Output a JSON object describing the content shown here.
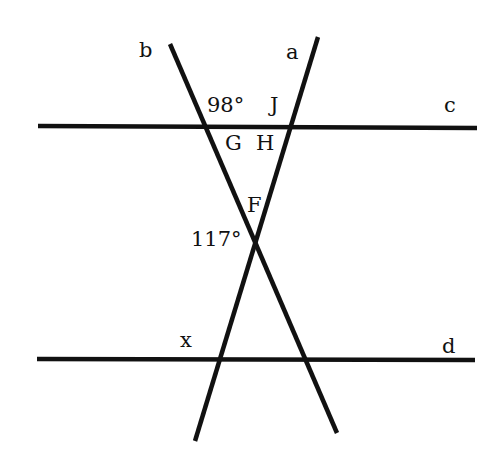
{
  "diagram": {
    "lines": {
      "c": {
        "label": "c",
        "x1": 38,
        "y1": 126,
        "x2": 477,
        "y2": 128
      },
      "d": {
        "label": "d",
        "x1": 37,
        "y1": 359,
        "x2": 475,
        "y2": 360
      },
      "a": {
        "label": "a",
        "x1": 318,
        "y1": 37,
        "x2": 195,
        "y2": 441
      },
      "b": {
        "label": "b",
        "x1": 170,
        "y1": 44,
        "x2": 337,
        "y2": 433
      }
    },
    "labels": {
      "b": "b",
      "a": "a",
      "c": "c",
      "d": "d",
      "angle_98": "98°",
      "J": "J",
      "G": "G",
      "H": "H",
      "F": "F",
      "angle_117": "117°",
      "x": "x"
    },
    "given_angles": [
      {
        "name": "angle at b∩c, upper right",
        "value": "98°"
      },
      {
        "name": "angle at F, left",
        "value": "117°"
      }
    ],
    "unknown_angle": "x",
    "stroke_color": "#111111",
    "background": "#ffffff"
  }
}
